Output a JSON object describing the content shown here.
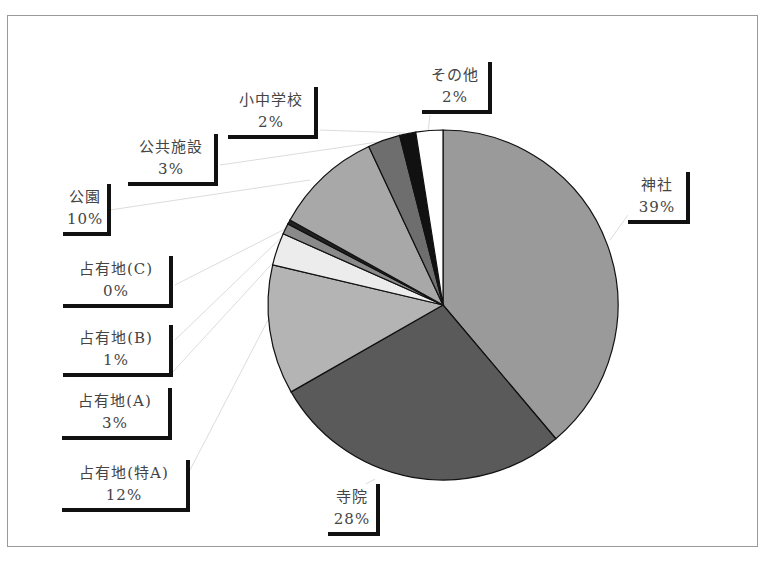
{
  "chart_data": {
    "type": "pie",
    "title": "",
    "start_angle_deg": 0,
    "direction": "clockwise",
    "slices": [
      {
        "label": "神社",
        "percent": 39,
        "value": 39,
        "color": "#9a9a9a"
      },
      {
        "label": "寺院",
        "percent": 28,
        "value": 28,
        "color": "#5a5a5a"
      },
      {
        "label": "占有地(特A)",
        "percent": 12,
        "value": 12,
        "color": "#b4b4b4"
      },
      {
        "label": "占有地(A)",
        "percent": 3,
        "value": 3,
        "color": "#ececec"
      },
      {
        "label": "占有地(B)",
        "percent": 1,
        "value": 1,
        "color": "#8a8a8a"
      },
      {
        "label": "占有地(C)",
        "percent": 0,
        "value": 0.4,
        "color": "#222222"
      },
      {
        "label": "公園",
        "percent": 10,
        "value": 10,
        "color": "#a8a8a8"
      },
      {
        "label": "公共施設",
        "percent": 3,
        "value": 3,
        "color": "#6e6e6e"
      },
      {
        "label": "小中学校",
        "percent": 2,
        "value": 1.5,
        "color": "#111111"
      },
      {
        "label": "その他",
        "percent": 2,
        "value": 2.5,
        "color": "#ffffff"
      }
    ],
    "legend": "none (data labels with callouts)"
  },
  "labels": {
    "jinja": {
      "name": "神社",
      "pct": "39%"
    },
    "jiin": {
      "name": "寺院",
      "pct": "28%"
    },
    "tokuA": {
      "name": "占有地(特A)",
      "pct": "12%"
    },
    "A": {
      "name": "占有地(A)",
      "pct": "3%"
    },
    "B": {
      "name": "占有地(B)",
      "pct": "1%"
    },
    "C": {
      "name": "占有地(C)",
      "pct": "0%"
    },
    "koen": {
      "name": "公園",
      "pct": "10%"
    },
    "kokyo": {
      "name": "公共施設",
      "pct": "3%"
    },
    "gakko": {
      "name": "小中学校",
      "pct": "2%"
    },
    "sonota": {
      "name": "その他",
      "pct": "2%"
    }
  }
}
